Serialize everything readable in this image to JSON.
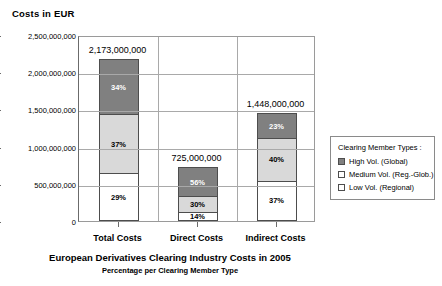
{
  "axis_caption": "Costs in EUR",
  "chart_title": "European Derivatives Clearing Industry Costs in 2005",
  "chart_subtitle": "Percentage per Clearing Member Type",
  "legend": {
    "title": "Clearing Member Types :",
    "items": [
      {
        "label": "High Vol. (Global)",
        "key": "high",
        "color": "#808080"
      },
      {
        "label": "Medium Vol. (Reg.-Glob.)",
        "key": "med",
        "color": "#d9d9d9"
      },
      {
        "label": "Low Vol. (Regional)",
        "key": "low",
        "color": "#ffffff"
      }
    ]
  },
  "chart_data": {
    "type": "bar",
    "subtype": "stacked-column",
    "title": "European Derivatives Clearing Industry Costs in 2005",
    "subtitle": "Percentage per Clearing Member Type",
    "xlabel": "",
    "ylabel": "Costs in EUR",
    "ylim": [
      0,
      2500000000
    ],
    "grid": true,
    "legend_position": "right",
    "categories": [
      "Total Costs",
      "Direct Costs",
      "Indirect Costs"
    ],
    "ytick_labels": [
      "2,500,000,000",
      "2,000,000,000",
      "1,500,000,000",
      "1,000,000,000",
      "500,000,000",
      "0"
    ],
    "ytick_values": [
      2500000000,
      2000000000,
      1500000000,
      1000000000,
      500000000,
      0
    ],
    "totals": [
      2173000000,
      725000000,
      1448000000
    ],
    "total_labels": [
      "2,173,000,000",
      "725,000,000",
      "1,448,000,000"
    ],
    "series": [
      {
        "name": "High Vol. (Global)",
        "key": "high",
        "color": "#808080",
        "percent_labels": [
          "34%",
          "56%",
          "23%"
        ],
        "percents": [
          34,
          56,
          23
        ]
      },
      {
        "name": "Medium Vol. (Reg.-Glob.)",
        "key": "med",
        "color": "#d9d9d9",
        "percent_labels": [
          "37%",
          "30%",
          "40%"
        ],
        "percents": [
          37,
          30,
          40
        ]
      },
      {
        "name": "Low Vol. (Regional)",
        "key": "low",
        "color": "#ffffff",
        "percent_labels": [
          "29%",
          "14%",
          "37%"
        ],
        "percents": [
          29,
          14,
          37
        ]
      }
    ]
  }
}
